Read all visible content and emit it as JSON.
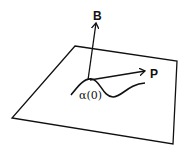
{
  "diagram": {
    "labels": {
      "binormal": "B",
      "vector_p": "P",
      "point": "α(0)"
    },
    "colors": {
      "stroke": "#111111",
      "background": "#ffffff"
    }
  }
}
